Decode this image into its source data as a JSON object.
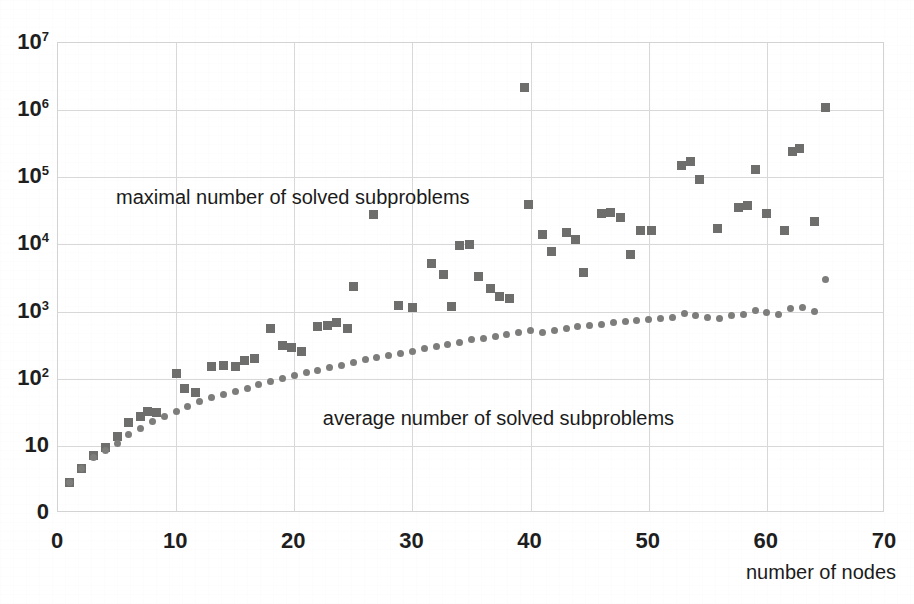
{
  "chart_data": {
    "type": "scatter",
    "title": "",
    "xlabel": "number of nodes",
    "ylabel": "",
    "xlim": [
      0,
      70
    ],
    "ylim_log": [
      1,
      10000000
    ],
    "yscale": "log",
    "grid": true,
    "legend_position": "inline-annotation",
    "x_ticks": [
      "0",
      "10",
      "20",
      "30",
      "40",
      "50",
      "60",
      "70"
    ],
    "x_tick_values": [
      0,
      10,
      20,
      30,
      40,
      50,
      60,
      70
    ],
    "y_ticks": [
      {
        "base": "10",
        "exp": "7",
        "value": 10000000
      },
      {
        "base": "10",
        "exp": "6",
        "value": 1000000
      },
      {
        "base": "10",
        "exp": "5",
        "value": 100000
      },
      {
        "base": "10",
        "exp": "4",
        "value": 10000
      },
      {
        "base": "10",
        "exp": "3",
        "value": 1000
      },
      {
        "base": "10",
        "exp": "2",
        "value": 100
      },
      {
        "base": "10",
        "exp": "",
        "value": 10
      },
      {
        "base": "0",
        "exp": "",
        "value": 1
      }
    ],
    "annotations": [
      {
        "text": "maximal number of solved subproblems",
        "x": 5.0,
        "y_px": 197
      },
      {
        "text": "average number of solved subproblems",
        "x": 22.5,
        "y_px": 418
      }
    ],
    "series": [
      {
        "name": "maximal number of solved subproblems",
        "marker": "square",
        "color": "#6e6e6d",
        "points": [
          [
            1,
            2.8
          ],
          [
            2,
            4.6
          ],
          [
            3,
            7.2
          ],
          [
            4,
            9.5
          ],
          [
            5,
            14
          ],
          [
            6,
            22
          ],
          [
            7,
            27
          ],
          [
            7.6,
            33
          ],
          [
            8.3,
            31
          ],
          [
            10,
            120
          ],
          [
            10.7,
            72
          ],
          [
            11.6,
            63
          ],
          [
            13,
            150
          ],
          [
            14,
            160
          ],
          [
            15,
            150
          ],
          [
            15.8,
            185
          ],
          [
            16.6,
            200
          ],
          [
            18,
            560
          ],
          [
            19,
            310
          ],
          [
            19.8,
            290
          ],
          [
            20.6,
            250
          ],
          [
            22,
            600
          ],
          [
            22.8,
            630
          ],
          [
            23.6,
            680
          ],
          [
            24.5,
            560
          ],
          [
            25,
            2400
          ],
          [
            26.7,
            28000
          ],
          [
            28.8,
            1250
          ],
          [
            30,
            1150
          ],
          [
            31.6,
            5200
          ],
          [
            32.6,
            3600
          ],
          [
            33.3,
            1200
          ],
          [
            34,
            9500
          ],
          [
            34.8,
            9900
          ],
          [
            35.6,
            3300
          ],
          [
            36.6,
            2200
          ],
          [
            37.4,
            1700
          ],
          [
            38.2,
            1550
          ],
          [
            39.5,
            2200000
          ],
          [
            39.8,
            39000
          ],
          [
            41,
            14000
          ],
          [
            41.8,
            7800
          ],
          [
            43,
            15000
          ],
          [
            43.8,
            12000
          ],
          [
            44.5,
            3800
          ],
          [
            46,
            29000
          ],
          [
            46.8,
            30000
          ],
          [
            47.6,
            25000
          ],
          [
            48.5,
            7000
          ],
          [
            49.3,
            16000
          ],
          [
            50.2,
            16000
          ],
          [
            52.8,
            150000
          ],
          [
            53.5,
            170000
          ],
          [
            54.3,
            92000
          ],
          [
            55.8,
            17500
          ],
          [
            57.6,
            36000
          ],
          [
            58.4,
            38000
          ],
          [
            59,
            130000
          ],
          [
            60,
            29000
          ],
          [
            61.5,
            16000
          ],
          [
            62.2,
            240000
          ],
          [
            62.8,
            270000
          ],
          [
            64,
            22000
          ],
          [
            65,
            1100000
          ]
        ]
      },
      {
        "name": "average number of solved subproblems",
        "marker": "circle",
        "color": "#7d7d7c",
        "points": [
          [
            1,
            2.8
          ],
          [
            2,
            4.6
          ],
          [
            3,
            6.6
          ],
          [
            4,
            8.5
          ],
          [
            5,
            11
          ],
          [
            6,
            15
          ],
          [
            7,
            18
          ],
          [
            8,
            23
          ],
          [
            9,
            27
          ],
          [
            10,
            33
          ],
          [
            11,
            38
          ],
          [
            12,
            45
          ],
          [
            13,
            52
          ],
          [
            14,
            58
          ],
          [
            15,
            65
          ],
          [
            16,
            72
          ],
          [
            17,
            82
          ],
          [
            18,
            92
          ],
          [
            19,
            100
          ],
          [
            20,
            110
          ],
          [
            21,
            122
          ],
          [
            22,
            132
          ],
          [
            23,
            145
          ],
          [
            24,
            158
          ],
          [
            25,
            172
          ],
          [
            26,
            190
          ],
          [
            27,
            205
          ],
          [
            28,
            222
          ],
          [
            29,
            240
          ],
          [
            30,
            255
          ],
          [
            31,
            280
          ],
          [
            32,
            300
          ],
          [
            33,
            320
          ],
          [
            34,
            350
          ],
          [
            35,
            380
          ],
          [
            36,
            400
          ],
          [
            37,
            430
          ],
          [
            38,
            455
          ],
          [
            39,
            480
          ],
          [
            40,
            520
          ],
          [
            41,
            480
          ],
          [
            42,
            530
          ],
          [
            43,
            560
          ],
          [
            44,
            590
          ],
          [
            45,
            620
          ],
          [
            46,
            650
          ],
          [
            47,
            680
          ],
          [
            48,
            700
          ],
          [
            49,
            730
          ],
          [
            50,
            760
          ],
          [
            51,
            790
          ],
          [
            52,
            820
          ],
          [
            53,
            950
          ],
          [
            54,
            870
          ],
          [
            55,
            830
          ],
          [
            56,
            800
          ],
          [
            57,
            870
          ],
          [
            58,
            890
          ],
          [
            59,
            1050
          ],
          [
            60,
            960
          ],
          [
            61,
            920
          ],
          [
            62,
            1100
          ],
          [
            63,
            1150
          ],
          [
            64,
            1000
          ],
          [
            65,
            3000
          ]
        ]
      }
    ]
  },
  "axes": {
    "x_title": "number of nodes"
  }
}
